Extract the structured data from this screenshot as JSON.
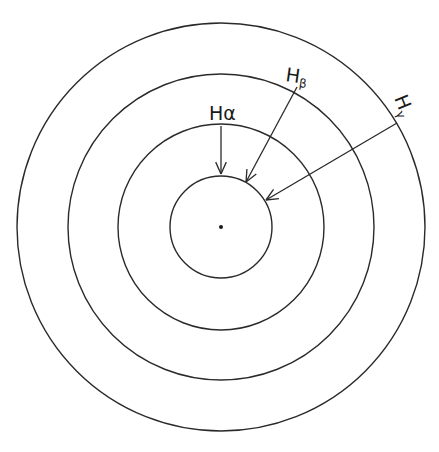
{
  "diagram": {
    "type": "concentric-rings",
    "center": {
      "x": 221,
      "y": 227
    },
    "center_dot_radius": 2,
    "rings": [
      {
        "name": "ring-1",
        "radius": 51
      },
      {
        "name": "ring-2",
        "radius": 103
      },
      {
        "name": "ring-3",
        "radius": 153
      },
      {
        "name": "ring-4",
        "radius": 204
      }
    ],
    "labels": [
      {
        "id": "h-alpha",
        "main": "H",
        "sub": "α",
        "x": 209,
        "y": 120,
        "rotate": 0,
        "arrow": {
          "x1": 221,
          "y1": 126,
          "x2": 221,
          "y2": 174
        }
      },
      {
        "id": "h-beta",
        "main": "H",
        "sub": "β",
        "x": 285,
        "y": 81,
        "rotate": 8,
        "arrow": {
          "x1": 297,
          "y1": 87,
          "x2": 246,
          "y2": 182
        }
      },
      {
        "id": "h-gamma",
        "main": "H",
        "sub": "γ",
        "x": 394,
        "y": 98,
        "rotate": 68,
        "arrow": {
          "x1": 397,
          "y1": 123,
          "x2": 266,
          "y2": 200
        }
      }
    ]
  }
}
